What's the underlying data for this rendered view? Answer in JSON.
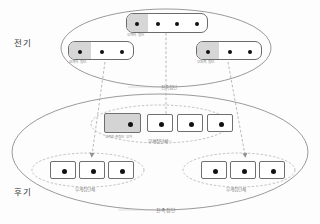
{
  "figure": {
    "type": "kinship-structure-diagram",
    "periods": [
      {
        "id": "early",
        "label": "전기",
        "caption": "친족집단"
      },
      {
        "id": "late",
        "label": "후기",
        "caption": "친족집단"
      }
    ],
    "colors": {
      "shade": "#d4d4d4",
      "outline": "#6f6f6f",
      "dot": "#111111",
      "dashed": "#9a9a9a",
      "text": "#7d7d7d"
    }
  },
  "early": {
    "side_label": "전기",
    "groups": [
      {
        "id": "top",
        "label": "부계의 집단",
        "dots": 4,
        "shaded_cells": 1
      },
      {
        "id": "left",
        "label": "모계의 집단",
        "dots": 3,
        "shaded_cells": 1
      },
      {
        "id": "right",
        "label": "부처계 집단",
        "dots": 3,
        "shaded_cells": 1
      }
    ],
    "boundary_caption": "친족집단"
  },
  "late": {
    "side_label": "후기",
    "center_group": {
      "label": "부계친족집단 부가",
      "caption": "부계집단체",
      "dots": 4,
      "shaded_index": 0
    },
    "left_group": {
      "caption": "부계집단체",
      "dots": 3
    },
    "right_group": {
      "caption": "부계집단체",
      "dots": 3
    },
    "boundary_caption": "친족집단"
  },
  "connectors": [
    {
      "from": "early.top",
      "to": "late.center",
      "style": "dashed-arrow"
    },
    {
      "from": "early.left",
      "to": "late.left",
      "style": "dashed-arrow"
    },
    {
      "from": "early.right",
      "to": "late.right",
      "style": "dashed-arrow"
    }
  ]
}
